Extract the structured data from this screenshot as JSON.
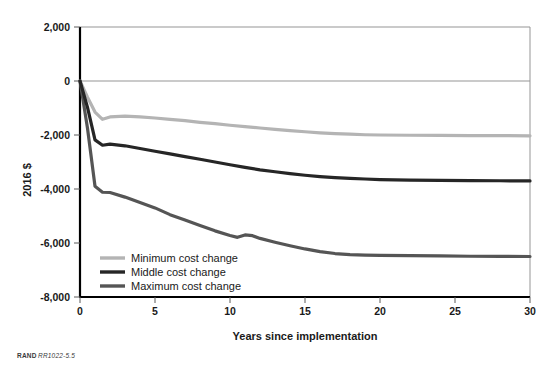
{
  "figure": {
    "source_note_prefix": "RAND",
    "source_note_id": "RR1022-5.5"
  },
  "chart_data": {
    "type": "line",
    "title": "",
    "xlabel": "Years since implementation",
    "ylabel": "2016 $",
    "xlim": [
      0,
      30
    ],
    "ylim": [
      -8000,
      2000
    ],
    "xticks": [
      0,
      5,
      10,
      15,
      20,
      25,
      30
    ],
    "xtick_labels": [
      "0",
      "5",
      "10",
      "15",
      "20",
      "25",
      "30"
    ],
    "yticks": [
      2000,
      0,
      -2000,
      -4000,
      -6000,
      -8000
    ],
    "ytick_labels": [
      "2,000",
      "0",
      "-2,000",
      "-4,000",
      "-6,000",
      "-8,000"
    ],
    "grid": "horizontal-at-2000-and-0",
    "legend_position": "lower-left-inside",
    "series": [
      {
        "name": "Minimum cost change",
        "color": "#b4b4b4",
        "x": [
          0,
          0.5,
          1.0,
          1.5,
          2.0,
          3.0,
          4.0,
          5.0,
          6.0,
          7.0,
          8.0,
          9.0,
          10.0,
          11.0,
          12.0,
          13.0,
          14.0,
          15.0,
          16.0,
          17.0,
          18.0,
          19.0,
          20.0,
          22.0,
          24.0,
          26.0,
          28.0,
          30.0
        ],
        "values": [
          0,
          -600,
          -1150,
          -1420,
          -1330,
          -1300,
          -1330,
          -1370,
          -1420,
          -1470,
          -1530,
          -1580,
          -1640,
          -1690,
          -1740,
          -1790,
          -1840,
          -1880,
          -1920,
          -1950,
          -1970,
          -1990,
          -2000,
          -2010,
          -2015,
          -2020,
          -2025,
          -2030
        ]
      },
      {
        "name": "Middle cost change",
        "color": "#262626",
        "x": [
          0,
          0.5,
          1.0,
          1.5,
          2.0,
          3.0,
          4.0,
          5.0,
          6.0,
          7.0,
          8.0,
          9.0,
          10.0,
          11.0,
          12.0,
          13.0,
          14.0,
          15.0,
          16.0,
          17.0,
          18.0,
          19.0,
          20.0,
          22.0,
          24.0,
          26.0,
          28.0,
          30.0
        ],
        "values": [
          0,
          -980,
          -2180,
          -2380,
          -2340,
          -2400,
          -2500,
          -2600,
          -2700,
          -2800,
          -2900,
          -3000,
          -3100,
          -3200,
          -3290,
          -3360,
          -3430,
          -3490,
          -3540,
          -3580,
          -3610,
          -3630,
          -3650,
          -3670,
          -3680,
          -3690,
          -3695,
          -3700
        ]
      },
      {
        "name": "Maximum cost change",
        "color": "#555555",
        "x": [
          0,
          0.5,
          1.0,
          1.5,
          2.0,
          3.0,
          4.0,
          5.0,
          6.0,
          7.0,
          8.0,
          9.0,
          10.0,
          10.5,
          11.0,
          11.5,
          12.0,
          13.0,
          14.0,
          15.0,
          16.0,
          17.0,
          18.0,
          19.0,
          20.0,
          22.0,
          24.0,
          26.0,
          28.0,
          30.0
        ],
        "values": [
          0,
          -1750,
          -3900,
          -4120,
          -4130,
          -4300,
          -4500,
          -4700,
          -4950,
          -5150,
          -5350,
          -5550,
          -5720,
          -5790,
          -5700,
          -5730,
          -5830,
          -5970,
          -6100,
          -6220,
          -6320,
          -6390,
          -6430,
          -6450,
          -6460,
          -6470,
          -6480,
          -6490,
          -6495,
          -6500
        ]
      }
    ]
  },
  "legend": {
    "items": [
      {
        "label": "Minimum cost change",
        "color": "#b4b4b4"
      },
      {
        "label": "Middle cost change",
        "color": "#262626"
      },
      {
        "label": "Maximum cost change",
        "color": "#555555"
      }
    ]
  }
}
